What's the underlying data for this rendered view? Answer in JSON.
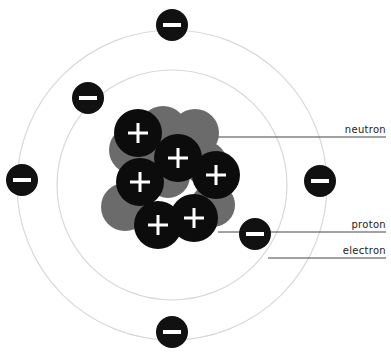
{
  "diagram": {
    "colors": {
      "background": "#ffffff",
      "orbit": "#d9d9d9",
      "electron": "#111111",
      "proton": "#0c0c0c",
      "neutron": "#6b6b6b",
      "sign": "#ffffff",
      "leader_line": "#444444",
      "label_text": "#222222"
    },
    "orbits": [
      {
        "name": "inner-orbit",
        "cx": 172,
        "cy": 185,
        "r": 115
      },
      {
        "name": "outer-orbit",
        "cx": 172,
        "cy": 185,
        "r": 155
      }
    ],
    "electrons": [
      {
        "cx": 172,
        "cy": 25,
        "r": 16,
        "sign": "−"
      },
      {
        "cx": 88,
        "cy": 98,
        "r": 16,
        "sign": "−"
      },
      {
        "cx": 22,
        "cy": 180,
        "r": 16,
        "sign": "−"
      },
      {
        "cx": 320,
        "cy": 181,
        "r": 16,
        "sign": "−"
      },
      {
        "cx": 255,
        "cy": 234,
        "r": 16,
        "sign": "−"
      },
      {
        "cx": 172,
        "cy": 332,
        "r": 16,
        "sign": "−"
      }
    ],
    "neutrons": [
      {
        "cx": 133,
        "cy": 150,
        "r": 24
      },
      {
        "cx": 163,
        "cy": 130,
        "r": 24
      },
      {
        "cx": 195,
        "cy": 133,
        "r": 24
      },
      {
        "cx": 205,
        "cy": 163,
        "r": 22
      },
      {
        "cx": 125,
        "cy": 207,
        "r": 24
      },
      {
        "cx": 168,
        "cy": 176,
        "r": 22
      },
      {
        "cx": 213,
        "cy": 205,
        "r": 22
      }
    ],
    "protons": [
      {
        "cx": 138,
        "cy": 133,
        "r": 24,
        "sign": "+"
      },
      {
        "cx": 178,
        "cy": 158,
        "r": 24,
        "sign": "+"
      },
      {
        "cx": 140,
        "cy": 182,
        "r": 24,
        "sign": "+"
      },
      {
        "cx": 216,
        "cy": 175,
        "r": 24,
        "sign": "+"
      },
      {
        "cx": 158,
        "cy": 225,
        "r": 24,
        "sign": "+"
      },
      {
        "cx": 194,
        "cy": 218,
        "r": 24,
        "sign": "+"
      }
    ],
    "labels": [
      {
        "name": "neutron",
        "text": "neutron",
        "x1": 215,
        "y": 137,
        "x2": 386,
        "text_y": 124
      },
      {
        "name": "proton",
        "text": "proton",
        "x1": 218,
        "y": 232,
        "x2": 386,
        "text_y": 219
      },
      {
        "name": "electron",
        "text": "electron",
        "x1": 268,
        "y": 258,
        "x2": 386,
        "text_y": 245
      }
    ]
  }
}
